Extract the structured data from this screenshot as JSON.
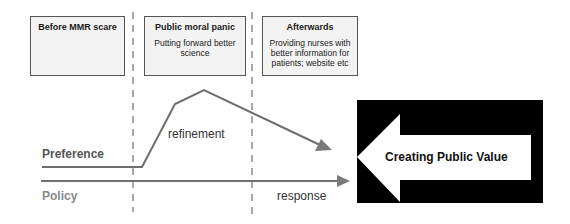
{
  "phases": [
    {
      "title": "Before MMR scare",
      "description": ""
    },
    {
      "title": "Public moral panic",
      "description": "Putting forward better science"
    },
    {
      "title": "Afterwards",
      "description": "Providing nurses with better information for patients; website etc"
    }
  ],
  "lines": {
    "preference_label": "Preference",
    "policy_label": "Policy",
    "refinement_label": "refinement",
    "response_label": "response"
  },
  "outcome": {
    "label": "Creating Public Value"
  },
  "colors": {
    "line": "#6e6e6e",
    "dashed": "#a8a8a8",
    "box_border": "#555555",
    "outcome_bg": "#000000",
    "outcome_arrow": "#ffffff"
  }
}
